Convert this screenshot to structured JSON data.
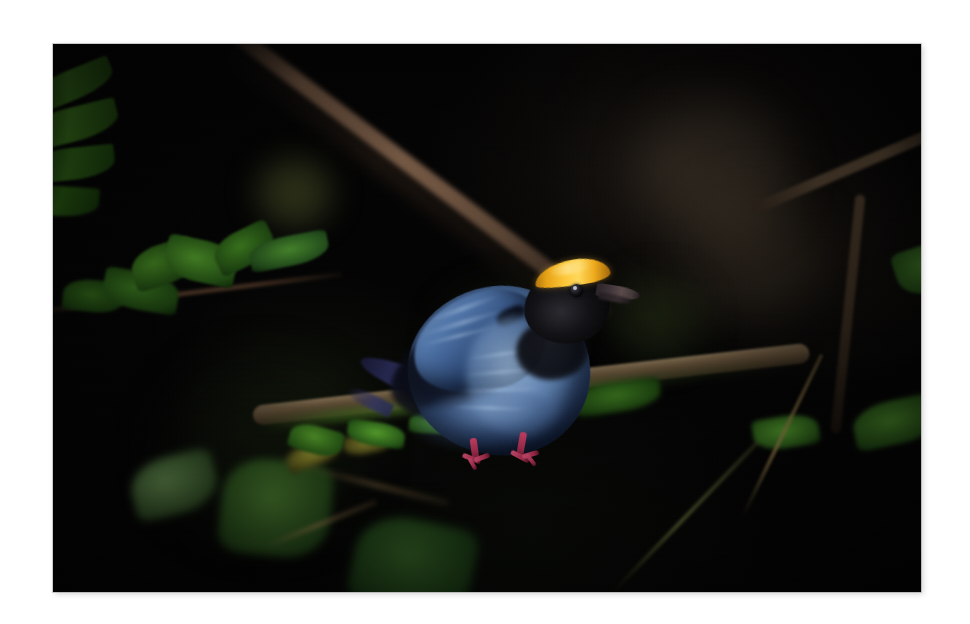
{
  "page": {
    "type": "photograph",
    "width": 970,
    "height": 624,
    "mat_color": "#ffffff",
    "caption": ""
  },
  "photo": {
    "frame": {
      "left": 53,
      "top": 44,
      "width": 868,
      "height": 548
    },
    "scene": "Night rainforest understory, flash-lit",
    "background_color": "#030303",
    "subject": {
      "common_name": "Swallow-tailed Manakin",
      "pose": "perched, facing right, body fluffed",
      "colors": {
        "crown": "#ffc93a",
        "crown_shadow": "#a86c0a",
        "face_mask": "#0a0a0c",
        "body_blue": "#5d81b2",
        "body_blue_light": "#7e9ec8",
        "body_blue_dark": "#1e3359",
        "wing_dark": "#16263f",
        "tail_violet": "#3a3c80",
        "bill": "#4a3d40",
        "legs": "#b8345a",
        "eye": "#000000"
      }
    },
    "elements": {
      "branch_main": {
        "label": "mossy perch branch",
        "color": "#7a6446",
        "moss_color": "#5c8c2a"
      },
      "branch_diagonal_top": {
        "label": "diagonal background branch",
        "color": "#866a4e"
      },
      "branch_right": {
        "label": "right-side branch",
        "color": "#5a462f"
      },
      "leaves_top_left": {
        "label": "upper-left leaf cluster",
        "color": "#2d5c16"
      },
      "leaves_mid_left": {
        "label": "mid-left twig with leaves",
        "color": "#4a8c26"
      },
      "leaves_lower_left": {
        "label": "lower-left dim foliage",
        "color": "#2a4420"
      },
      "leaves_right": {
        "label": "right-side leaves",
        "color": "#417a24"
      },
      "bokeh": {
        "label": "out-of-focus highlights",
        "olive": "#606832",
        "brown": "#5c4c3a"
      }
    }
  },
  "chart_data": null
}
